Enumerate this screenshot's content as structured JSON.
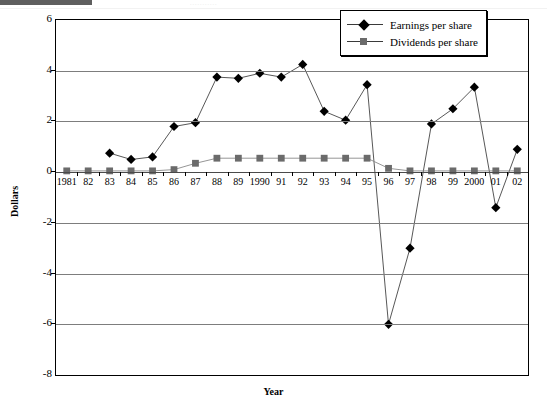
{
  "page": {
    "header_ghost_text": "..........."
  },
  "legend": {
    "position": "top-right",
    "entries": [
      {
        "label": "Earnings per share",
        "marker": "diamond-marker-icon",
        "color": "#000000"
      },
      {
        "label": "Dividends per share",
        "marker": "square-marker-icon",
        "color": "#6b6b6b"
      }
    ]
  },
  "axes": {
    "ylabel": "Dollars",
    "xlabel": "Year",
    "yticks": [
      "6",
      "4",
      "2",
      "0",
      "-2",
      "-4",
      "-6",
      "-8"
    ],
    "xticks": [
      "1981",
      "82",
      "83",
      "84",
      "85",
      "86",
      "87",
      "88",
      "89",
      "1990",
      "91",
      "92",
      "93",
      "94",
      "95",
      "96",
      "97",
      "98",
      "99",
      "2000",
      "01",
      "02"
    ]
  },
  "chart_data": {
    "type": "line",
    "title": "",
    "xlabel": "Year",
    "ylabel": "Dollars",
    "ylim": [
      -8,
      6
    ],
    "yticks": [
      6,
      4,
      2,
      0,
      -2,
      -4,
      -6,
      -8
    ],
    "grid": true,
    "legend_position": "top-right",
    "categories": [
      "1981",
      "82",
      "83",
      "84",
      "85",
      "86",
      "87",
      "88",
      "89",
      "1990",
      "91",
      "92",
      "93",
      "94",
      "95",
      "96",
      "97",
      "98",
      "99",
      "2000",
      "01",
      "02"
    ],
    "x": [
      1981,
      1982,
      1983,
      1984,
      1985,
      1986,
      1987,
      1988,
      1989,
      1990,
      1991,
      1992,
      1993,
      1994,
      1995,
      1996,
      1997,
      1998,
      1999,
      2000,
      2001,
      2002
    ],
    "series": [
      {
        "name": "Earnings per share",
        "marker": "diamond",
        "color": "#000000",
        "values": [
          null,
          null,
          0.75,
          0.5,
          0.6,
          1.8,
          1.95,
          3.75,
          3.7,
          3.9,
          3.75,
          4.25,
          2.4,
          2.05,
          3.45,
          -6.0,
          -3.0,
          1.9,
          2.5,
          3.35,
          -1.4,
          0.9
        ]
      },
      {
        "name": "Dividends per share",
        "marker": "square",
        "color": "#6b6b6b",
        "values": [
          0.05,
          0.05,
          0.05,
          0.05,
          0.05,
          0.1,
          0.35,
          0.55,
          0.55,
          0.55,
          0.55,
          0.55,
          0.55,
          0.55,
          0.55,
          0.15,
          0.05,
          0.05,
          0.05,
          0.05,
          0.05,
          0.05
        ]
      }
    ]
  }
}
